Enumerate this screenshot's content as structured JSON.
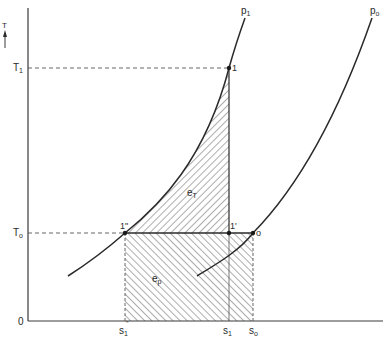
{
  "diagram": {
    "type": "T-s diagram (exergy of compression)",
    "axes": {
      "y_label": "T",
      "origin_label": "0",
      "y_ticks": [
        {
          "label": "T",
          "sub": "1",
          "y": 68
        },
        {
          "label": "T",
          "sub": "o",
          "y": 233
        }
      ],
      "x_ticks": [
        {
          "label": "s",
          "sub": "1",
          "sup": "\"",
          "x": 125
        },
        {
          "label": "s",
          "sub": "1",
          "x": 229
        },
        {
          "label": "s",
          "sub": "o",
          "x": 253
        }
      ]
    },
    "curves": [
      {
        "name": "isobar-p1",
        "label": "p",
        "sub": "1"
      },
      {
        "name": "isobar-p0",
        "label": "p",
        "sub": "o"
      }
    ],
    "points": [
      {
        "id": "1",
        "label": "1"
      },
      {
        "id": "1prime",
        "label": "1'"
      },
      {
        "id": "1doubleprime",
        "label": "1\""
      },
      {
        "id": "o",
        "label": "o"
      }
    ],
    "areas": [
      {
        "id": "eT",
        "label": "e",
        "sub": "T"
      },
      {
        "id": "ep",
        "label": "e",
        "sub": "p"
      }
    ]
  }
}
